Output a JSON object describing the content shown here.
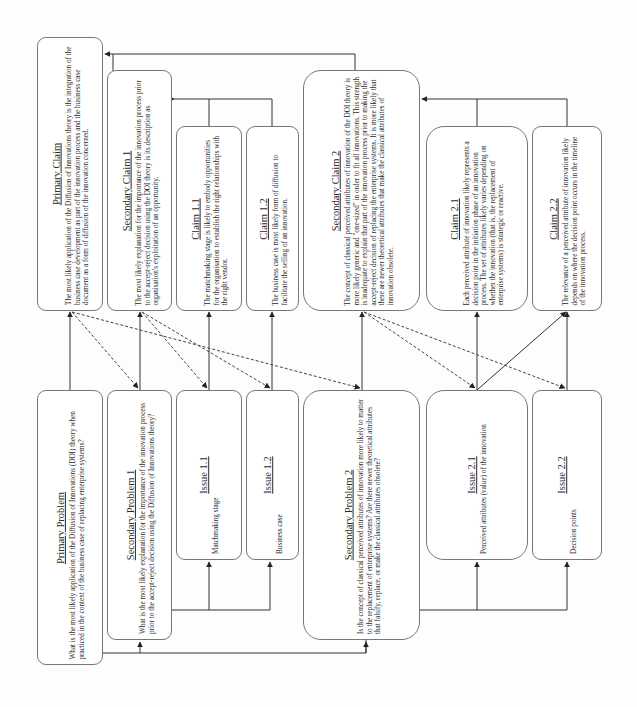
{
  "diagram": {
    "orientation": "rotated-90-ccw",
    "claims": [
      {
        "id": "primary-claim",
        "title": "Primary Claim",
        "text": "The most likely application of the Diffusion of Innovations theory is the integration of the business case development as part of the innovation process and the business case document as a form of diffusion of the innovation concerned."
      },
      {
        "id": "secondary-claim-1",
        "title": "Secondary Claim 1",
        "text": "The most likely explanation for the importance of the innovation process prior to the accept-reject decision using the DOI theory is its description as organisation's exploitation of an opportunity."
      },
      {
        "id": "claim-1-1",
        "title": "Claim 1.1",
        "text": "The matchmaking stage is likely to embody opportunities for the organisation to establish the right relationships with the right vendor."
      },
      {
        "id": "claim-1-2",
        "title": "Claim 1.2",
        "text": "The business case is most likely form of diffusion to facilitate the selling of an innovation."
      },
      {
        "id": "secondary-claim-2",
        "title": "Secondary Claim 2",
        "text": "The concept of classical perceived attributes of innovation of the DOI theory is more likely generic and \"one-sized\" in order to fit all innovations. This strength is inadequate to explain that part of the innovation process prior to making the accept-reject decision of replacing the enterprise systems. It is more likely that there are newer theoretical attributes that make the classical attributes of innovation obsolete."
      },
      {
        "id": "claim-2-1",
        "title": "Claim 2.1",
        "text": "Each perceived attribute of innovation likely represents a decision point in the initiation phase of an innovation process. The set of attributes likely varies depending on whether the innovation (that is, the replacement of enterprise systems) is strategic or reactive."
      },
      {
        "id": "claim-2-2",
        "title": "Claim 2.2",
        "text": "The relevance of a perceived attribute of innovation likely depends on where the decision point occurs in the timeline of the innovation process."
      }
    ],
    "problems": [
      {
        "id": "primary-problem",
        "title": "Primary Problem",
        "text": "What is the most likely application of the Diffusion of Innovations (DOI) theory when practiced in the context of the business case of replacing enterprise systems?"
      },
      {
        "id": "secondary-problem-1",
        "title": "Secondary Problem 1",
        "text": "What is the most likely explanation for the importance of the innovation process prior to the accept-reject decision using the Diffusion of Innovations theory?"
      },
      {
        "id": "issue-1-1",
        "title": "Issue 1.1",
        "text": "Matchmaking stage"
      },
      {
        "id": "issue-1-2",
        "title": "Issue 1.2",
        "text": "Business case"
      },
      {
        "id": "secondary-problem-2",
        "title": "Secondary Problem 2",
        "text": "Is the concept of classical perceived attributes of innovation more likely to matter to the replacement of enterprise systems? Are there newer theoretical attributes that falsify, replace, or make the classical attributes obsolete?"
      },
      {
        "id": "issue-2-1",
        "title": "Issue 2.1",
        "text": "Perceived attributes (value) of the innovation"
      },
      {
        "id": "issue-2-2",
        "title": "Issue 2.2",
        "text": "Decision points"
      }
    ],
    "colors": {
      "line": "#333333",
      "border": "#777777",
      "background": "#fdfdfd"
    }
  }
}
